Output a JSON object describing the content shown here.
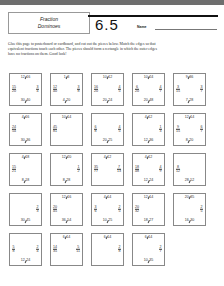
{
  "header": {
    "title_line1": "Fraction",
    "title_line2": "Dominoes",
    "lesson_number": "6.5",
    "name_label": "Name"
  },
  "instructions": "Glue this page to posterboard or cardboard, and cut out the pieces below. Match the edges so that equivalent fractions touch each other. The pieces should form a rectangle in which the outer edges have no fractions on them. Good luck!",
  "tiles": [
    {
      "row": 0,
      "col": 0,
      "top": "12/16",
      "left": "15/20",
      "right": "3/4",
      "bottom": "30/40"
    },
    {
      "row": 0,
      "col": 1,
      "top": "1/3",
      "left": "12/40",
      "right": "3/8",
      "bottom": "4/20"
    },
    {
      "row": 0,
      "col": 2,
      "top": "10/12",
      "left": "16/20",
      "right": "4/5",
      "bottom": "20/24"
    },
    {
      "row": 0,
      "col": 3,
      "top": "10/24",
      "left": "6/20",
      "right": "4/7",
      "bottom": "20/48"
    },
    {
      "row": 0,
      "col": 4,
      "top": "9/36",
      "left": "3/15",
      "right": "3/7",
      "bottom": "7/28"
    },
    {
      "row": 1,
      "col": 0,
      "top": "4/16",
      "left": "24/54",
      "right": "",
      "bottom": "30/36"
    },
    {
      "row": 1,
      "col": 1,
      "top": "10/14",
      "left": "45/81",
      "right": "",
      "bottom": ""
    },
    {
      "row": 1,
      "col": 2,
      "top": "",
      "left": "6/8",
      "right": "4/5",
      "bottom": "20/25"
    },
    {
      "row": 1,
      "col": 3,
      "top": "4/12",
      "left": "",
      "right": "1/3",
      "bottom": "12/36"
    },
    {
      "row": 1,
      "col": 4,
      "top": "12/14",
      "left": "9/15",
      "right": "6/7",
      "bottom": "8/20"
    },
    {
      "row": 2,
      "col": 0,
      "top": "4/18",
      "left": "15/21",
      "right": "",
      "bottom": "8/18"
    },
    {
      "row": 2,
      "col": 1,
      "top": "12/20",
      "left": "",
      "right": "1/2",
      "bottom": "8/28"
    },
    {
      "row": 2,
      "col": 2,
      "top": "4/12",
      "left": "35/77",
      "right": "7/13",
      "bottom": ""
    },
    {
      "row": 2,
      "col": 3,
      "top": "4/12",
      "left": "18/48",
      "right": "4/9",
      "bottom": "12/24"
    },
    {
      "row": 2,
      "col": 4,
      "top": "",
      "left": "8/12",
      "right": "",
      "bottom": "28/52"
    },
    {
      "row": 3,
      "col": 0,
      "top": "",
      "left": "",
      "right": "2/3",
      "bottom": "30/45"
    },
    {
      "row": 3,
      "col": 1,
      "top": "12/16",
      "left": "20/45",
      "right": "",
      "bottom": "36/54"
    },
    {
      "row": 3,
      "col": 2,
      "top": "4/14",
      "left": "3/6",
      "right": "2/5",
      "bottom": "10/25"
    },
    {
      "row": 3,
      "col": 3,
      "top": "12/14",
      "left": "20/32",
      "right": "",
      "bottom": "18/27"
    },
    {
      "row": 3,
      "col": 4,
      "top": "20/35",
      "left": "",
      "right": "2/5",
      "bottom": "16/30"
    },
    {
      "row": 4,
      "col": 0,
      "top": "",
      "left": "5/8",
      "right": "2/4",
      "bottom": "12/24"
    },
    {
      "row": 4,
      "col": 1,
      "top": "6/14",
      "left": "14/35",
      "right": "5/11",
      "bottom": ""
    },
    {
      "row": 4,
      "col": 2,
      "top": "6/14",
      "left": "",
      "right": "2/8",
      "bottom": ""
    },
    {
      "row": 4,
      "col": 3,
      "top": "6/14",
      "left": "",
      "right": "2/7",
      "bottom": "10/35"
    }
  ]
}
